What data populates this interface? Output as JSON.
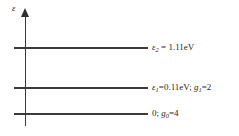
{
  "figure": {
    "type": "energy-level-diagram",
    "background_color": "#ffffff",
    "line_color": "#3b3b3b",
    "text_color": "#1f1f1f",
    "axis": {
      "label": "ε",
      "orientation": "vertical",
      "arrow": "up"
    },
    "levels": [
      {
        "id": "level-2",
        "energy_symbol": "ε",
        "energy_subscript": "2",
        "energy_value": "1.11eV",
        "separator": " = ",
        "label_text": "ε₂ = 1.11eV",
        "degeneracy_symbol": "",
        "degeneracy_subscript": "",
        "degeneracy_value": ""
      },
      {
        "id": "level-1",
        "energy_symbol": "ε",
        "energy_subscript": "1",
        "energy_value": "0.11eV",
        "separator": "=",
        "label_text": "ε₁=0.11eV; g₁=2",
        "degeneracy_symbol": "g",
        "degeneracy_subscript": "1",
        "degeneracy_value": "2"
      },
      {
        "id": "level-0",
        "energy_symbol": "",
        "energy_subscript": "",
        "energy_value": "0",
        "separator": "",
        "label_text": "0; g₀=4",
        "degeneracy_symbol": "g",
        "degeneracy_subscript": "0",
        "degeneracy_value": "4"
      }
    ],
    "punctuation": {
      "semicolon": "; ",
      "equals": "="
    }
  }
}
